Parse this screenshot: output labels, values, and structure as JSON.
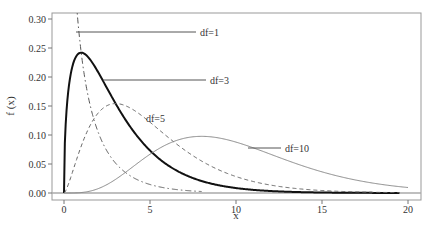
{
  "chart_data": {
    "type": "line",
    "title": "",
    "xlabel": "x",
    "ylabel": "f (x)",
    "xlim": [
      -0.7,
      20.7
    ],
    "ylim": [
      -0.012,
      0.31
    ],
    "x_ticks": [
      0,
      5,
      10,
      15,
      20
    ],
    "x_tick_labels": [
      "0",
      "5",
      "10",
      "15",
      "20"
    ],
    "y_ticks": [
      0.0,
      0.05,
      0.1,
      0.15,
      0.2,
      0.25,
      0.3
    ],
    "y_tick_labels": [
      "0.00",
      "0.05",
      "0.10",
      "0.15",
      "0.20",
      "0.25",
      "0.30"
    ],
    "grid": false,
    "legend": "inline labels",
    "distribution": "chi-square density",
    "series": [
      {
        "name": "df=1",
        "df": 1,
        "style": "dash-dot",
        "color": "#555555",
        "width": 1,
        "x": [
          0.05,
          0.5,
          1,
          2,
          3,
          4,
          5,
          6,
          7,
          8
        ],
        "values": [
          1.7603,
          0.4394,
          0.242,
          0.1038,
          0.0514,
          0.027,
          0.0146,
          0.0081,
          0.0045,
          0.0025
        ],
        "label": "df=1",
        "label_pos": [
          427,
          32
        ],
        "leader_from": [
          76,
          32
        ]
      },
      {
        "name": "df=3",
        "df": 3,
        "style": "solid",
        "color": "#111111",
        "width": 2,
        "x": [
          0,
          1,
          2,
          3,
          4,
          5,
          6,
          8,
          10,
          12,
          15,
          19.5
        ],
        "values": [
          0,
          0.242,
          0.2076,
          0.1542,
          0.108,
          0.0732,
          0.0487,
          0.0206,
          0.0085,
          0.0034,
          0.0008,
          0.0001
        ],
        "label": "df=3",
        "label_pos": [
          427,
          80
        ],
        "leader_from": [
          103,
          80
        ]
      },
      {
        "name": "df=5",
        "df": 5,
        "style": "dashed",
        "color": "#666666",
        "width": 1,
        "x": [
          0,
          1,
          2,
          3,
          4,
          5,
          6,
          8,
          10,
          12,
          15,
          19.5
        ],
        "values": [
          0,
          0.0807,
          0.1384,
          0.1542,
          0.144,
          0.122,
          0.0974,
          0.0551,
          0.0283,
          0.0137,
          0.0044,
          0.0006
        ],
        "label": "df=5",
        "label_pos": [
          427,
          118
        ],
        "leader_from": [
          142,
          118
        ]
      },
      {
        "name": "df=10",
        "df": 10,
        "style": "solid",
        "color": "#888888",
        "width": 1,
        "x": [
          0,
          2,
          4,
          6,
          8,
          10,
          12,
          14,
          16,
          18,
          20
        ],
        "values": [
          0,
          0.0153,
          0.0722,
          0.0896,
          0.0977,
          0.0877,
          0.0669,
          0.0454,
          0.0286,
          0.0167,
          0.0094
        ],
        "label": "df=10",
        "label_pos": [
          427,
          148
        ],
        "leader_from": [
          258,
          148
        ]
      }
    ]
  }
}
